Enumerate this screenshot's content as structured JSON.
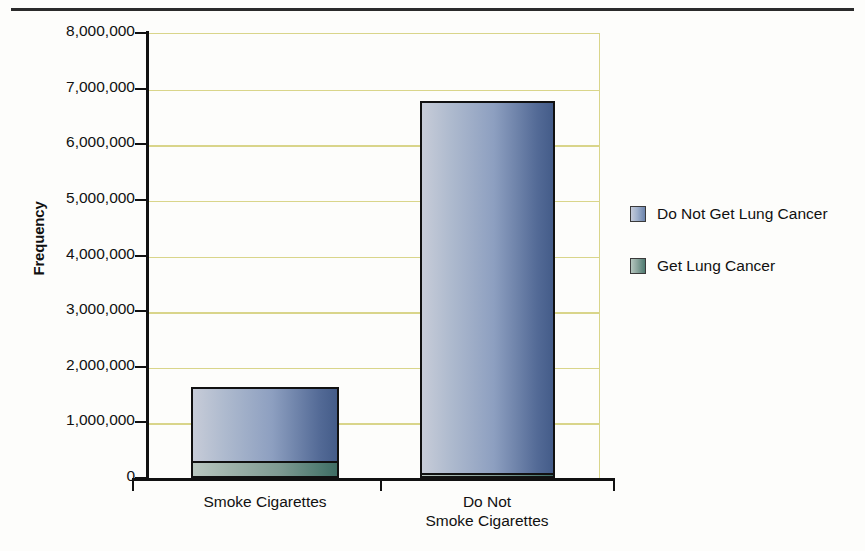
{
  "chart_data": {
    "type": "bar",
    "subtype": "stacked",
    "title": "",
    "xlabel": "",
    "ylabel": "Frequency",
    "ylim": [
      0,
      8000000
    ],
    "ytick_step": 1000000,
    "ytick_labels": [
      "8,000,000",
      "7,000,000",
      "6,000,000",
      "5,000,000",
      "4,000,000",
      "3,000,000",
      "2,000,000",
      "1,000,000",
      "0"
    ],
    "ytick_values": [
      8000000,
      7000000,
      6000000,
      5000000,
      4000000,
      3000000,
      2000000,
      1000000,
      0
    ],
    "categories": [
      "Smoke Cigarettes",
      "Do Not Smoke Cigarettes"
    ],
    "category_label_lines": [
      [
        "Smoke Cigarettes"
      ],
      [
        "Do Not",
        "Smoke Cigarettes"
      ]
    ],
    "series": [
      {
        "name": "Do Not Get Lung Cancer",
        "color": "#8d9fc0",
        "values": [
          1330000,
          6690000
        ]
      },
      {
        "name": "Get Lung Cancer",
        "color": "#4e7a70",
        "values": [
          300000,
          90000
        ]
      }
    ],
    "totals": [
      1630000,
      6780000
    ],
    "grid": true,
    "grid_color": "#d9d58a",
    "legend_position": "right",
    "legend_entries": [
      "Do Not Get Lung Cancer",
      "Get Lung Cancer"
    ]
  },
  "axis": {
    "y_title": "Frequency"
  },
  "legend": {
    "items": [
      {
        "label": "Do Not Get Lung Cancer",
        "swatch": "blue"
      },
      {
        "label": "Get Lung Cancer",
        "swatch": "teal"
      }
    ]
  },
  "header": {
    "cropped_title": ""
  },
  "colors": {
    "grid": "#d9d58a",
    "axis": "#111111",
    "series_no_cancer": "#8d9fc0",
    "series_cancer": "#4e7a70"
  }
}
